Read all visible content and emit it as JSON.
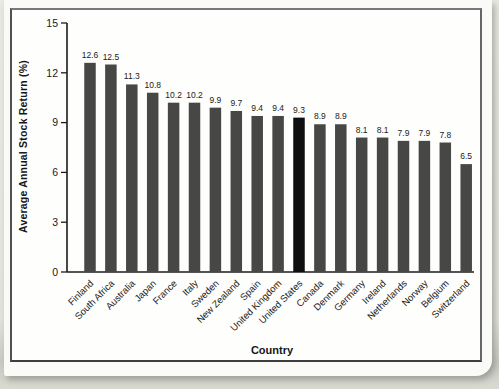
{
  "chart_data": {
    "type": "bar",
    "title": "",
    "xlabel": "Country",
    "ylabel": "Average Annual Stock Return (%)",
    "categories": [
      "Finland",
      "South Africa",
      "Australia",
      "Japan",
      "France",
      "Italy",
      "Sweden",
      "New Zealand",
      "Spain",
      "United Kingdom",
      "United States",
      "Canada",
      "Denmark",
      "Germany",
      "Ireland",
      "Netherlands",
      "Norway",
      "Belgium",
      "Switzerland"
    ],
    "values": [
      12.6,
      12.5,
      11.3,
      10.8,
      10.2,
      10.2,
      9.9,
      9.7,
      9.4,
      9.4,
      9.3,
      8.9,
      8.9,
      8.1,
      8.1,
      7.9,
      7.9,
      7.8,
      6.5
    ],
    "ylim": [
      0,
      15
    ],
    "yticks": [
      0,
      3,
      6,
      9,
      12,
      15
    ],
    "grid": false,
    "legend": null,
    "data_labels": true,
    "highlight_category": "United States",
    "colors": {
      "bar": "#474746",
      "highlight": "#0f0f0f",
      "axis": "#1b1b1b",
      "text": "#161616",
      "chart_background": "#fefefd",
      "page_background": "#e3e5de"
    }
  }
}
